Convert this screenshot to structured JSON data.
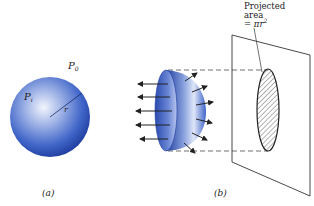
{
  "figure_a": {
    "caption": "(a)",
    "outer_pressure_label": "P",
    "outer_pressure_sub": "0",
    "inner_pressure_label": "P",
    "inner_pressure_sub": "i",
    "radius_label": "r"
  },
  "figure_b": {
    "caption": "(b)",
    "annotation_line1": "Projected",
    "annotation_line2": "area",
    "annotation_line3_prefix": "= πr",
    "annotation_line3_sup": "2"
  },
  "colors": {
    "sphere_dark": "#1f3d9e",
    "sphere_mid": "#3f64c8",
    "sphere_light": "#e8eefb",
    "line": "#333333"
  }
}
